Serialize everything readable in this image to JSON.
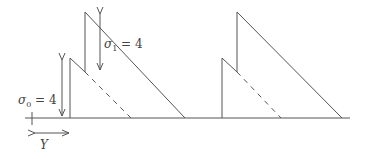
{
  "diagram": {
    "labels": {
      "sigma0": "σ",
      "sigma0_sub": "0",
      "sigma0_eq": " = 4",
      "sigma1": "σ",
      "sigma1_sub": "1",
      "sigma1_eq": " = 4",
      "y_label": "Y"
    },
    "colors": {
      "line": "#555555",
      "background": "#ffffff"
    }
  }
}
